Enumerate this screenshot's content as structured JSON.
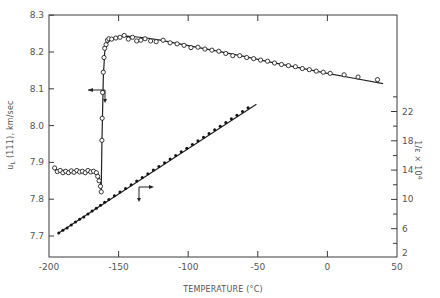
{
  "chart_data": {
    "type": "scatter",
    "title": "",
    "xlabel": "TEMPERATURE (°C)",
    "ylabel": "u_L (111), km/sec",
    "ylabel_right": "1/ε × 10^4",
    "xlim": [
      -200,
      50
    ],
    "ylim": [
      7.64,
      8.3
    ],
    "ylim_right": [
      2,
      26
    ],
    "x_ticks": [
      -200,
      -150,
      -100,
      -50,
      0,
      50
    ],
    "x_tick_labels": [
      "-200",
      "-150",
      "-100",
      "-50",
      "0",
      "50"
    ],
    "y_ticks": [
      7.7,
      7.8,
      7.9,
      8.0,
      8.1,
      8.2,
      8.3
    ],
    "y_tick_labels": [
      "7.7",
      "7.8",
      "7.9",
      "8.0",
      "8.1",
      "8.2",
      "8.3"
    ],
    "y_right_ticks": [
      2,
      6,
      10,
      14,
      18,
      22
    ],
    "y_right_tick_labels": [
      "2",
      "6",
      "10",
      "14",
      "18",
      "22"
    ],
    "grid": false,
    "legend": "none (arrows indicate axis: open circles → left axis, filled dots → right axis)",
    "series": [
      {
        "name": "u_L (111) velocity",
        "axis": "left",
        "marker": "open-circle",
        "x": [
          -196,
          -194,
          -192,
          -190,
          -188,
          -186,
          -184,
          -182,
          -180,
          -178,
          -176,
          -174,
          -172,
          -170,
          -168,
          -166,
          -165,
          -164,
          -163,
          -162.5,
          -162,
          -161.8,
          -161.5,
          -161,
          -160.5,
          -160,
          -159,
          -158,
          -157,
          -155,
          -152,
          -149,
          -146,
          -143,
          -140,
          -137,
          -134,
          -131,
          -127,
          -123,
          -118,
          -113,
          -108,
          -103,
          -98,
          -93,
          -88,
          -83,
          -78,
          -73,
          -68,
          -63,
          -58,
          -53,
          -48,
          -43,
          -38,
          -33,
          -28,
          -23,
          -18,
          -13,
          -8,
          -3,
          2,
          12,
          22,
          36
        ],
        "y": [
          7.885,
          7.875,
          7.878,
          7.872,
          7.876,
          7.872,
          7.877,
          7.873,
          7.878,
          7.874,
          7.876,
          7.872,
          7.878,
          7.874,
          7.876,
          7.872,
          7.862,
          7.85,
          7.835,
          7.82,
          7.96,
          8.02,
          8.09,
          8.145,
          8.185,
          8.21,
          8.22,
          8.232,
          8.236,
          8.235,
          8.238,
          8.24,
          8.245,
          8.235,
          8.24,
          8.23,
          8.232,
          8.236,
          8.23,
          8.228,
          8.232,
          8.225,
          8.222,
          8.218,
          8.212,
          8.213,
          8.208,
          8.205,
          8.202,
          8.196,
          8.19,
          8.19,
          8.185,
          8.182,
          8.178,
          8.175,
          8.17,
          8.166,
          8.163,
          8.16,
          8.155,
          8.152,
          8.148,
          8.145,
          8.142,
          8.138,
          8.132,
          8.125
        ]
      },
      {
        "name": "u_L (111) fit curve",
        "axis": "left",
        "marker": "line",
        "x": [
          -196,
          -180,
          -170,
          -165,
          -163,
          -162.5,
          -162,
          -161,
          -160,
          -158,
          -155,
          -150,
          -145,
          -140,
          -130,
          -120,
          -100,
          -80,
          -60,
          -40,
          -20,
          0,
          20,
          40
        ],
        "y": [
          7.88,
          7.876,
          7.875,
          7.87,
          7.845,
          7.82,
          7.95,
          8.13,
          8.2,
          8.225,
          8.235,
          8.241,
          8.243,
          8.242,
          8.238,
          8.232,
          8.217,
          8.203,
          8.188,
          8.172,
          8.157,
          8.142,
          8.128,
          8.114
        ]
      },
      {
        "name": "1/ε × 10^4",
        "axis": "right",
        "marker": "filled-dot",
        "x": [
          -193,
          -190,
          -187,
          -184,
          -181,
          -178,
          -175,
          -172,
          -169,
          -166,
          -163,
          -160,
          -157,
          -153,
          -149,
          -145,
          -141,
          -137,
          -133,
          -129,
          -125,
          -121,
          -117,
          -113,
          -109,
          -105,
          -101,
          -97,
          -93,
          -89,
          -85,
          -81,
          -77,
          -73,
          -69,
          -65,
          -61,
          -57
        ],
        "y": [
          5.4,
          5.8,
          6.1,
          6.5,
          6.9,
          7.3,
          7.6,
          8.0,
          8.4,
          8.8,
          9.2,
          9.6,
          10.0,
          10.5,
          11.0,
          11.5,
          12.0,
          12.5,
          13.0,
          13.5,
          14.0,
          14.5,
          15.0,
          15.5,
          16.0,
          16.5,
          17.0,
          17.5,
          18.0,
          18.5,
          19.0,
          19.5,
          20.0,
          20.5,
          21.0,
          21.5,
          22.0,
          22.5
        ]
      },
      {
        "name": "1/ε fit line",
        "axis": "right",
        "marker": "line",
        "x": [
          -193,
          -51
        ],
        "y": [
          5.4,
          23.0
        ]
      }
    ],
    "annotations": [
      {
        "type": "arrow",
        "direction": "left",
        "meaning": "open circles refer to left axis",
        "near": [
          -166,
          8.09
        ]
      },
      {
        "type": "arrow",
        "direction": "right",
        "meaning": "filled dots refer to right axis",
        "near": [
          -137,
          7.79
        ]
      }
    ]
  }
}
